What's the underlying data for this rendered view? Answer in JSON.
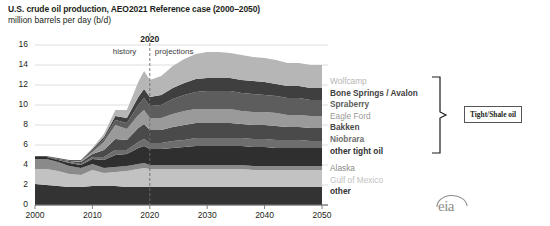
{
  "header": {
    "title": "U.S. crude oil production, AEO2021 Reference case (2000–2050)",
    "subtitle": "million barrels per day (b/d)"
  },
  "annotations": {
    "divider_year": "2020",
    "history_label": "history",
    "projections_label": "projections",
    "bracket_label": "Tight/Shale oil",
    "logo": "eia"
  },
  "legend": {
    "position": "right",
    "items": [
      {
        "label": "Wolfcamp",
        "color": "#b6b6b6",
        "bold": false
      },
      {
        "label": "Bone Springs / Avalon",
        "color": "#3f3f3f",
        "bold": true
      },
      {
        "label": "Spraberry",
        "color": "#5d5d5d",
        "bold": true
      },
      {
        "label": "Eagle Ford",
        "color": "#9a9a9a",
        "bold": false
      },
      {
        "label": "Bakken",
        "color": "#4a4a4a",
        "bold": true
      },
      {
        "label": "Niobrara",
        "color": "#6e6e6e",
        "bold": true
      },
      {
        "label": "other tight oil",
        "color": "#2f2f2f",
        "bold": true
      },
      {
        "label": "Alaska",
        "color": "#8a8a8a",
        "bold": false
      },
      {
        "label": "Gulf of Mexico",
        "color": "#c2c2c2",
        "bold": false
      },
      {
        "label": "other",
        "color": "#333333",
        "bold": true
      }
    ]
  },
  "chart_data": {
    "type": "area",
    "title": "U.S. crude oil production, AEO2021 Reference case (2000–2050)",
    "xlabel": "",
    "ylabel": "million barrels per day (b/d)",
    "xlim": [
      2000,
      2050
    ],
    "ylim": [
      0,
      16
    ],
    "ytick_labels": [
      "0",
      "2",
      "4",
      "6",
      "8",
      "10",
      "12",
      "14",
      "16"
    ],
    "ytick_values": [
      0,
      2,
      4,
      6,
      8,
      10,
      12,
      14,
      16
    ],
    "xtick_labels": [
      "2000",
      "2010",
      "2020",
      "2030",
      "2040",
      "2050"
    ],
    "xtick_values": [
      2000,
      2010,
      2020,
      2030,
      2040,
      2050
    ],
    "grid": true,
    "stacked": true,
    "history_projection_split": 2020,
    "x": [
      2000,
      2002,
      2004,
      2006,
      2008,
      2010,
      2012,
      2014,
      2016,
      2018,
      2019,
      2020,
      2022,
      2024,
      2026,
      2028,
      2030,
      2032,
      2034,
      2036,
      2038,
      2040,
      2042,
      2044,
      2046,
      2048,
      2050
    ],
    "series": [
      {
        "name": "other",
        "color": "#333333",
        "values": [
          2.1,
          2.0,
          1.9,
          1.8,
          1.8,
          1.9,
          1.9,
          1.9,
          1.8,
          1.8,
          1.8,
          1.8,
          1.8,
          1.8,
          1.8,
          1.8,
          1.8,
          1.8,
          1.8,
          1.8,
          1.8,
          1.8,
          1.8,
          1.8,
          1.8,
          1.8,
          1.8
        ]
      },
      {
        "name": "Gulf of Mexico",
        "color": "#c2c2c2",
        "values": [
          1.5,
          1.6,
          1.5,
          1.3,
          1.2,
          1.6,
          1.3,
          1.4,
          1.6,
          1.8,
          1.9,
          1.8,
          1.8,
          1.8,
          1.8,
          1.8,
          1.8,
          1.8,
          1.8,
          1.8,
          1.7,
          1.7,
          1.7,
          1.7,
          1.7,
          1.7,
          1.7
        ]
      },
      {
        "name": "Alaska",
        "color": "#8a8a8a",
        "values": [
          1.0,
          1.0,
          0.9,
          0.8,
          0.7,
          0.6,
          0.5,
          0.5,
          0.5,
          0.5,
          0.5,
          0.4,
          0.4,
          0.4,
          0.4,
          0.4,
          0.4,
          0.4,
          0.4,
          0.4,
          0.4,
          0.4,
          0.4,
          0.4,
          0.4,
          0.4,
          0.4
        ]
      },
      {
        "name": "other tight oil",
        "color": "#2f2f2f",
        "values": [
          0.2,
          0.2,
          0.2,
          0.3,
          0.3,
          0.5,
          0.8,
          1.2,
          1.2,
          1.6,
          1.7,
          1.6,
          1.6,
          1.7,
          1.8,
          1.9,
          1.9,
          1.9,
          1.9,
          1.9,
          1.9,
          1.9,
          1.8,
          1.8,
          1.8,
          1.8,
          1.8
        ]
      },
      {
        "name": "Niobrara",
        "color": "#6e6e6e",
        "values": [
          0.0,
          0.0,
          0.0,
          0.1,
          0.1,
          0.2,
          0.3,
          0.5,
          0.4,
          0.6,
          0.7,
          0.6,
          0.6,
          0.7,
          0.7,
          0.8,
          0.8,
          0.8,
          0.8,
          0.8,
          0.8,
          0.8,
          0.8,
          0.8,
          0.8,
          0.7,
          0.7
        ]
      },
      {
        "name": "Bakken",
        "color": "#4a4a4a",
        "values": [
          0.0,
          0.0,
          0.1,
          0.1,
          0.2,
          0.3,
          0.7,
          1.1,
          1.0,
          1.4,
          1.5,
          1.3,
          1.3,
          1.4,
          1.5,
          1.5,
          1.5,
          1.5,
          1.5,
          1.4,
          1.4,
          1.4,
          1.4,
          1.3,
          1.3,
          1.3,
          1.3
        ]
      },
      {
        "name": "Eagle Ford",
        "color": "#9a9a9a",
        "values": [
          0.0,
          0.0,
          0.0,
          0.0,
          0.1,
          0.2,
          0.8,
          1.4,
          1.1,
          1.3,
          1.4,
          1.2,
          1.2,
          1.3,
          1.4,
          1.4,
          1.4,
          1.4,
          1.4,
          1.3,
          1.3,
          1.3,
          1.3,
          1.2,
          1.2,
          1.2,
          1.2
        ]
      },
      {
        "name": "Spraberry",
        "color": "#5d5d5d",
        "values": [
          0.1,
          0.1,
          0.1,
          0.1,
          0.1,
          0.2,
          0.3,
          0.5,
          0.6,
          1.0,
          1.2,
          1.2,
          1.3,
          1.5,
          1.6,
          1.7,
          1.8,
          1.8,
          1.8,
          1.8,
          1.8,
          1.7,
          1.7,
          1.7,
          1.7,
          1.6,
          1.6
        ]
      },
      {
        "name": "Bone Springs / Avalon",
        "color": "#3f3f3f",
        "values": [
          0.0,
          0.0,
          0.0,
          0.0,
          0.0,
          0.1,
          0.2,
          0.4,
          0.5,
          0.8,
          0.9,
          0.9,
          1.0,
          1.1,
          1.2,
          1.3,
          1.3,
          1.3,
          1.3,
          1.3,
          1.3,
          1.3,
          1.2,
          1.2,
          1.2,
          1.2,
          1.2
        ]
      },
      {
        "name": "Wolfcamp",
        "color": "#b6b6b6",
        "values": [
          0.0,
          0.0,
          0.0,
          0.0,
          0.0,
          0.1,
          0.3,
          0.6,
          0.8,
          1.5,
          1.8,
          1.7,
          1.9,
          2.2,
          2.4,
          2.5,
          2.6,
          2.6,
          2.5,
          2.5,
          2.4,
          2.4,
          2.4,
          2.3,
          2.3,
          2.3,
          2.3
        ]
      }
    ]
  }
}
